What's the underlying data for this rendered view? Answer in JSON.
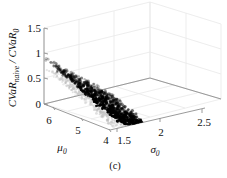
{
  "figure": {
    "caption": "(c)",
    "background_color": "#ffffff",
    "axis_color": "#8a8a8a",
    "grid_color": "#e2e2e2",
    "marker_color": "#000000",
    "shadow_color": "#b9b9b9"
  },
  "chart_data": {
    "type": "scatter",
    "title": "",
    "caption": "(c)",
    "projection": "3d",
    "grid": true,
    "legend": null,
    "zlabel_parts": {
      "numerator": "CVaR",
      "numerator_sub": "naive",
      "separator": " / ",
      "denominator": "CVaR",
      "denominator_sub": "0"
    },
    "zlabel": "CVaR_naive / CVaR_0",
    "xlabel": "μ",
    "xlabel_sub": "0",
    "ylabel": "σ",
    "ylabel_sub": "0",
    "xticks": [
      6,
      5,
      4
    ],
    "xticklabels": [
      "6",
      "5",
      "4"
    ],
    "yticks": [
      1.5,
      2,
      2.5
    ],
    "yticklabels": [
      "1.5",
      "2",
      "2.5"
    ],
    "zticks": [
      0,
      0.5,
      1,
      1.5
    ],
    "zticklabels": [
      "0",
      "0.5",
      "1",
      "1.5"
    ],
    "xlim": [
      4,
      6.5
    ],
    "ylim": [
      1.4,
      2.6
    ],
    "zlim": [
      0,
      1.5
    ],
    "series": [
      {
        "name": "CVaR ratio samples",
        "marker": "o",
        "color": "#000000",
        "n_points": 900,
        "value_range": [
          0.18,
          0.98
        ],
        "trend": "decreasing with sigma_0 and decreasing mu_0"
      },
      {
        "name": "projected shadow",
        "marker": "o",
        "color": "#bdbdbd",
        "n_points": 600,
        "value_range": [
          0.0,
          0.0
        ],
        "trend": "base-plane projection of the sample cloud"
      }
    ]
  }
}
